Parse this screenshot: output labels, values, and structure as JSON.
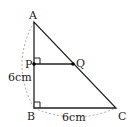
{
  "diagram": {
    "points": {
      "A": {
        "label": "A",
        "x": 34,
        "y": 22
      },
      "B": {
        "label": "B",
        "x": 34,
        "y": 108
      },
      "C": {
        "label": "C",
        "x": 116,
        "y": 108
      },
      "P": {
        "label": "P",
        "x": 34,
        "y": 64
      },
      "Q": {
        "label": "Q",
        "x": 73,
        "y": 64
      }
    },
    "measurements": {
      "AB": "6cm",
      "BC": "6cm"
    },
    "line_color": "#222222",
    "dashed_color": "#aaaaaa"
  }
}
